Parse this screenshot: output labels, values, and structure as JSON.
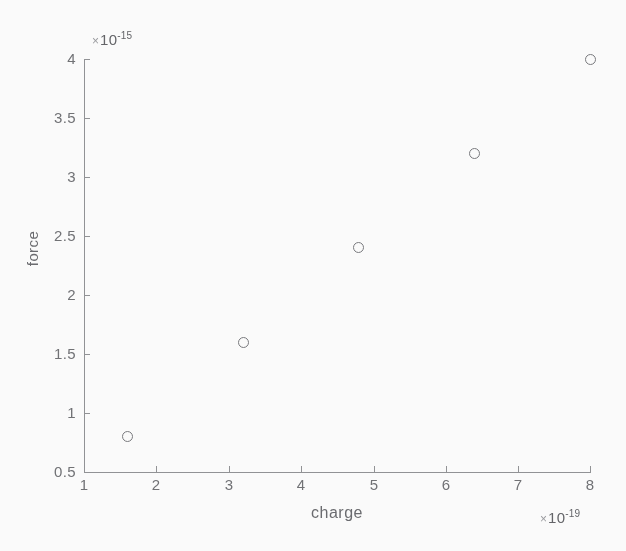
{
  "chart_data": {
    "type": "scatter",
    "title": "",
    "xlabel": "charge",
    "ylabel": "force",
    "x_exponent_label": "× 10",
    "x_exponent_value": "-19",
    "y_exponent_label": "× 10",
    "y_exponent_value": "-15",
    "x_tick_labels": [
      "1",
      "2",
      "3",
      "4",
      "5",
      "6",
      "7",
      "8"
    ],
    "x_tick_values": [
      1,
      2,
      3,
      4,
      5,
      6,
      7,
      8
    ],
    "y_tick_labels": [
      "0.5",
      "1",
      "1.5",
      "2",
      "2.5",
      "3",
      "3.5",
      "4"
    ],
    "y_tick_values": [
      0.5,
      1,
      1.5,
      2,
      2.5,
      3,
      3.5,
      4
    ],
    "xlim": [
      1,
      8
    ],
    "ylim": [
      0.5,
      4
    ],
    "grid": false,
    "legend": null,
    "marker_style": "open-circle",
    "marker_color": "#76777b",
    "axis_color": "#8f9094",
    "background_color": "#ffffff",
    "x": [
      1.6,
      3.2,
      4.8,
      6.4,
      8.0
    ],
    "y": [
      0.8,
      1.6,
      2.4,
      3.2,
      4.0
    ],
    "points": [
      {
        "x": 1.6,
        "y": 0.8
      },
      {
        "x": 3.2,
        "y": 1.6
      },
      {
        "x": 4.8,
        "y": 2.4
      },
      {
        "x": 6.4,
        "y": 3.2
      },
      {
        "x": 8.0,
        "y": 4.0
      }
    ]
  },
  "axes": {
    "ylabel": "force",
    "xlabel": "charge"
  },
  "exponents": {
    "y_mult": "×",
    "y_base": "10",
    "y_sup": "-15",
    "x_mult": "×",
    "x_base": "10",
    "x_sup": "-19"
  }
}
